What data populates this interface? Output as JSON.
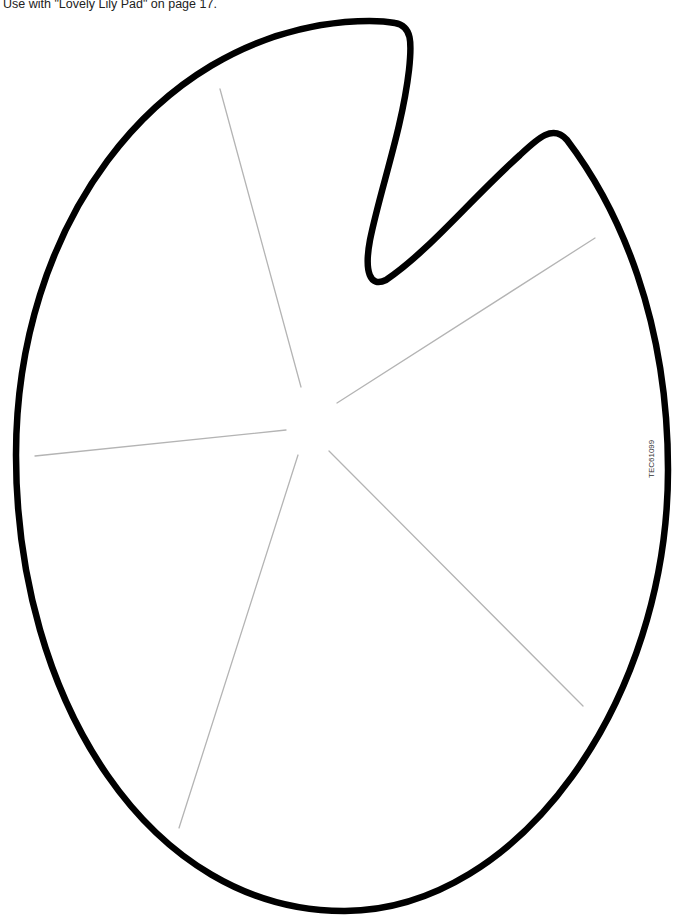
{
  "page": {
    "caption": "Use with \"Lovely Lily Pad\" on page 17.",
    "product_code": "TEC61099"
  },
  "figure": {
    "outline_color": "#000000",
    "vein_color": "#b4b4b4",
    "vein_count": 5
  }
}
